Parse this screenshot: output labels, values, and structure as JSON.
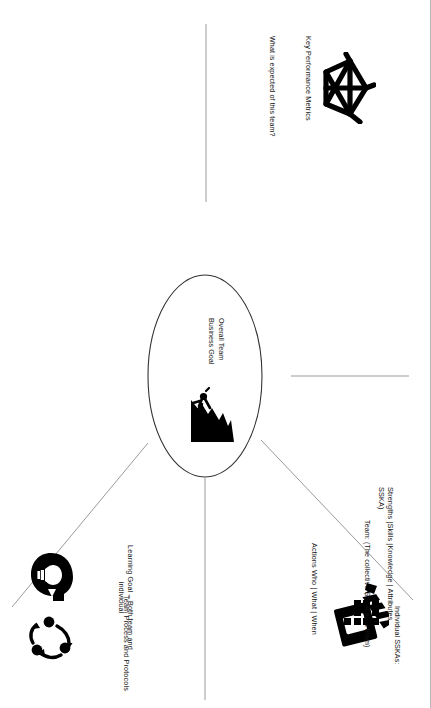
{
  "document": {
    "type": "team-charter-canvas",
    "title": "Overall Team Business Goal",
    "orientation": "landscape-rotated-90",
    "background_color": "#ffffff",
    "line_color": "#9a9a9a",
    "ink_color": "#000000"
  },
  "hub": {
    "label": "Overall Team\nBusiness Goal",
    "icon": "rock-climber-icon"
  },
  "sections": [
    {
      "id": "kpi",
      "title": "Key Performance Metrics",
      "subtitle": "What is expected of this team?",
      "icon": "radar-web-icon"
    },
    {
      "id": "actions",
      "title": "Actions  Who | What | When",
      "subtitle": "",
      "icon": "clapperboard-icon"
    },
    {
      "id": "learning",
      "title": "Learning Goal – Both team and\nindividual",
      "subtitle": "",
      "icon": "head-lightbulb-icon"
    },
    {
      "id": "process",
      "title": "Team Process and Protocols",
      "subtitle": "",
      "icon": "cycle-arrows-icon"
    },
    {
      "id": "strengths",
      "title": "Strengths |Skills |Knowledge | Attributes\nSSKA)",
      "team_line": "Team: (The collective SSKA as a team)",
      "individual_line": "Individual SSKAs:",
      "icon": "brick-grid-icon"
    }
  ]
}
